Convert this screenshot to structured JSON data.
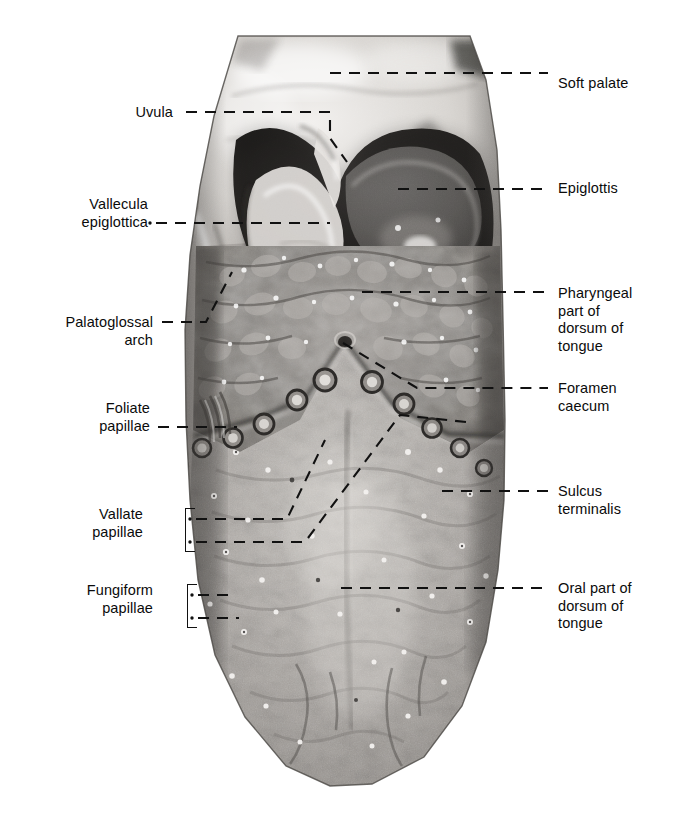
{
  "figure": {
    "kind": "anatomical-photograph",
    "background_color": "#ffffff",
    "label_color": "#0b0b0b",
    "leader_color": "#111111"
  },
  "labels": {
    "left": [
      {
        "id": "uvula",
        "lines": [
          "Uvula"
        ],
        "x": 173,
        "y": 104,
        "leader": {
          "type": "dashed-polyline",
          "points": [
            [
              186,
              112
            ],
            [
              330,
              112
            ],
            [
              330,
              138
            ],
            [
              347,
              162
            ]
          ],
          "start_dot": false
        }
      },
      {
        "id": "vallecula-epiglottica",
        "lines": [
          "Vallecula",
          "epiglottica"
        ],
        "x": 148,
        "y": 196,
        "leader": {
          "type": "dashed-polyline",
          "points": [
            [
              156,
              223
            ],
            [
              330,
              223
            ]
          ],
          "start_dot": true
        }
      },
      {
        "id": "palatoglossal-arch",
        "lines": [
          "Palatoglossal",
          "arch"
        ],
        "x": 153,
        "y": 314,
        "leader": {
          "type": "dashed-polyline",
          "points": [
            [
              162,
              322
            ],
            [
              206,
              322
            ],
            [
              232,
              272
            ]
          ],
          "start_dot": false
        }
      },
      {
        "id": "foliate-papillae",
        "lines": [
          "Foliate",
          "papillae"
        ],
        "x": 150,
        "y": 400,
        "leader": {
          "type": "dashed-polyline",
          "points": [
            [
              158,
              427
            ],
            [
              237,
              427
            ]
          ],
          "start_dot": false
        }
      },
      {
        "id": "vallate-papillae",
        "lines": [
          "Vallate",
          "papillae"
        ],
        "x": 143,
        "y": 506,
        "brace": {
          "x": 185,
          "y": 508,
          "height": 42
        },
        "leader": {
          "type": "dashed-polyline-pair",
          "points_a": [
            [
              196,
              519
            ],
            [
              287,
              519
            ],
            [
              325,
              440
            ]
          ],
          "points_b": [
            [
              196,
              542
            ],
            [
              305,
              542
            ],
            [
              400,
              415
            ],
            [
              466,
              422
            ]
          ],
          "start_dot": true
        }
      },
      {
        "id": "fungiform-papillae",
        "lines": [
          "Fungiform",
          "papillae"
        ],
        "x": 153,
        "y": 582,
        "brace": {
          "x": 187,
          "y": 584,
          "height": 42
        },
        "leader": {
          "type": "dashed-polyline-pair",
          "points_a": [
            [
              198,
              595
            ],
            [
              231,
              595
            ]
          ],
          "points_b": [
            [
              198,
              618
            ],
            [
              239,
              618
            ]
          ],
          "start_dot": true
        }
      }
    ],
    "right": [
      {
        "id": "soft-palate",
        "lines": [
          "Soft palate"
        ],
        "x": 558,
        "y": 75,
        "leader": {
          "type": "dashed-polyline",
          "points": [
            [
              330,
              73
            ],
            [
              548,
              73
            ]
          ],
          "start_dot": false
        }
      },
      {
        "id": "epiglottis",
        "lines": [
          "Epiglottis"
        ],
        "x": 558,
        "y": 180,
        "leader": {
          "type": "dashed-polyline",
          "points": [
            [
              398,
              189
            ],
            [
              548,
              189
            ]
          ],
          "start_dot": false
        }
      },
      {
        "id": "pharyngeal-part-of-dorsum-of-tongue",
        "lines": [
          "Pharyngeal",
          "part of",
          "dorsum of",
          "tongue"
        ],
        "x": 558,
        "y": 285,
        "leader": {
          "type": "dashed-polyline",
          "points": [
            [
              362,
              292
            ],
            [
              548,
              292
            ]
          ],
          "start_dot": false
        }
      },
      {
        "id": "foramen-caecum",
        "lines": [
          "Foramen",
          "caecum"
        ],
        "x": 558,
        "y": 380,
        "leader": {
          "type": "dashed-polyline",
          "points": [
            [
              343,
              343
            ],
            [
              417,
              388
            ],
            [
              548,
              388
            ]
          ],
          "start_dot": false
        }
      },
      {
        "id": "sulcus-terminalis",
        "lines": [
          "Sulcus",
          "terminalis"
        ],
        "x": 558,
        "y": 483,
        "leader": {
          "type": "dashed-polyline",
          "points": [
            [
              442,
              491
            ],
            [
              548,
              491
            ]
          ],
          "start_dot": false
        }
      },
      {
        "id": "oral-part-of-dorsum-of-tongue",
        "lines": [
          "Oral part of",
          "dorsum of",
          "tongue"
        ],
        "x": 558,
        "y": 580,
        "leader": {
          "type": "dashed-polyline",
          "points": [
            [
              341,
              588
            ],
            [
              548,
              588
            ]
          ],
          "start_dot": false
        }
      }
    ]
  },
  "specimen": {
    "regions": [
      {
        "id": "soft-palate-region",
        "tone": "light"
      },
      {
        "id": "uvula-region",
        "tone": "light"
      },
      {
        "id": "epiglottis-region",
        "tone": "light"
      },
      {
        "id": "vallecula-region",
        "tone": "dark"
      },
      {
        "id": "pharyngeal-part-region",
        "tone": "mid-dark"
      },
      {
        "id": "oral-part-region",
        "tone": "mid-light"
      }
    ],
    "vallate_papillae_count": 11,
    "fungiform_papillae_count": 34
  }
}
